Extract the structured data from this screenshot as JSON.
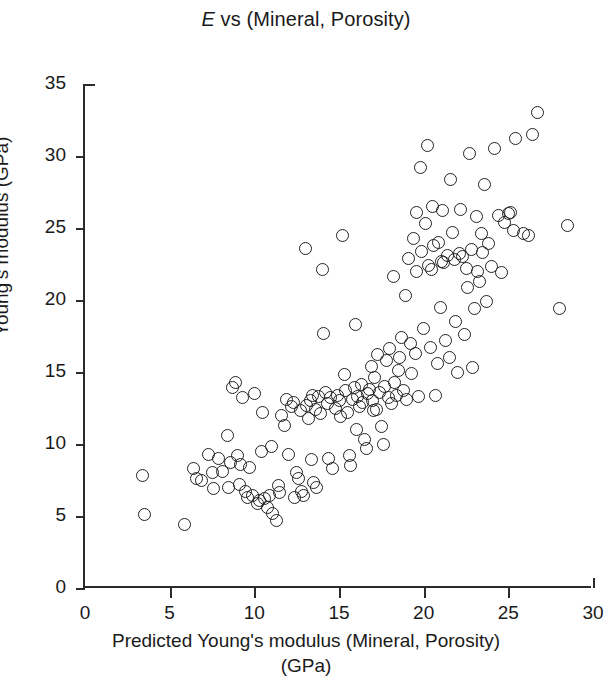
{
  "chart_data": {
    "type": "scatter",
    "title": "E vs (Mineral, Porosity)",
    "title_italic_prefix": "E",
    "title_rest": " vs (Mineral, Porosity)",
    "xlabel_line1": "Predicted Young's modulus (Mineral, Porosity)",
    "xlabel_line2": "(GPa)",
    "ylabel": "Young's modulus (GPa)",
    "xlim": [
      0,
      30
    ],
    "ylim": [
      0,
      35
    ],
    "xticks": [
      0,
      5,
      10,
      15,
      20,
      25,
      30
    ],
    "yticks": [
      0,
      5,
      10,
      15,
      20,
      25,
      30,
      35
    ],
    "xtick_labels": [
      "0",
      "5",
      "10",
      "15",
      "20",
      "25",
      "30"
    ],
    "ytick_labels": [
      "0",
      "5",
      "10",
      "15",
      "20",
      "25",
      "30",
      "35"
    ],
    "grid": false,
    "legend": null,
    "marker": "open-circle",
    "marker_color": "#222222",
    "n_points": 176,
    "points": [
      [
        3.4,
        7.8
      ],
      [
        3.5,
        5.1
      ],
      [
        5.9,
        4.4
      ],
      [
        6.4,
        8.3
      ],
      [
        6.6,
        7.6
      ],
      [
        6.9,
        7.5
      ],
      [
        7.3,
        9.3
      ],
      [
        7.5,
        8.0
      ],
      [
        7.6,
        6.9
      ],
      [
        7.9,
        9.0
      ],
      [
        8.1,
        8.1
      ],
      [
        8.4,
        10.6
      ],
      [
        8.5,
        7.0
      ],
      [
        8.6,
        8.7
      ],
      [
        8.7,
        13.9
      ],
      [
        8.9,
        14.3
      ],
      [
        9.0,
        9.2
      ],
      [
        9.1,
        7.2
      ],
      [
        9.3,
        13.2
      ],
      [
        9.5,
        6.7
      ],
      [
        9.6,
        6.3
      ],
      [
        9.7,
        8.4
      ],
      [
        9.9,
        6.4
      ],
      [
        10.0,
        13.5
      ],
      [
        10.2,
        5.9
      ],
      [
        10.3,
        6.1
      ],
      [
        10.4,
        9.5
      ],
      [
        10.5,
        12.2
      ],
      [
        10.6,
        6.2
      ],
      [
        10.8,
        5.6
      ],
      [
        10.9,
        6.4
      ],
      [
        11.0,
        9.8
      ],
      [
        11.1,
        5.2
      ],
      [
        11.3,
        4.7
      ],
      [
        11.4,
        7.1
      ],
      [
        11.5,
        6.6
      ],
      [
        11.6,
        12.0
      ],
      [
        11.8,
        11.3
      ],
      [
        11.9,
        13.1
      ],
      [
        12.0,
        9.3
      ],
      [
        12.2,
        12.6
      ],
      [
        12.3,
        12.9
      ],
      [
        12.5,
        8.0
      ],
      [
        12.6,
        7.6
      ],
      [
        12.7,
        12.3
      ],
      [
        12.8,
        6.7
      ],
      [
        12.9,
        6.4
      ],
      [
        13.0,
        23.6
      ],
      [
        13.1,
        12.7
      ],
      [
        13.2,
        11.8
      ],
      [
        13.3,
        13.0
      ],
      [
        13.4,
        8.9
      ],
      [
        13.5,
        7.3
      ],
      [
        13.6,
        12.4
      ],
      [
        13.7,
        7.0
      ],
      [
        13.8,
        13.3
      ],
      [
        13.9,
        12.1
      ],
      [
        14.0,
        22.1
      ],
      [
        14.1,
        17.7
      ],
      [
        14.2,
        13.6
      ],
      [
        14.3,
        12.8
      ],
      [
        14.4,
        9.0
      ],
      [
        14.5,
        13.2
      ],
      [
        14.6,
        8.3
      ],
      [
        14.8,
        12.5
      ],
      [
        14.9,
        13.4
      ],
      [
        15.0,
        13.0
      ],
      [
        15.1,
        11.9
      ],
      [
        15.2,
        24.5
      ],
      [
        15.3,
        14.8
      ],
      [
        15.4,
        13.7
      ],
      [
        15.5,
        12.2
      ],
      [
        15.6,
        9.2
      ],
      [
        15.7,
        8.5
      ],
      [
        15.8,
        13.1
      ],
      [
        15.9,
        13.9
      ],
      [
        16.0,
        18.3
      ],
      [
        16.1,
        13.3
      ],
      [
        16.2,
        12.6
      ],
      [
        16.3,
        14.1
      ],
      [
        16.4,
        12.9
      ],
      [
        16.5,
        10.3
      ],
      [
        16.6,
        9.7
      ],
      [
        16.7,
        13.5
      ],
      [
        16.8,
        13.8
      ],
      [
        16.9,
        15.4
      ],
      [
        17.0,
        13.0
      ],
      [
        17.1,
        14.6
      ],
      [
        17.2,
        12.4
      ],
      [
        17.3,
        16.2
      ],
      [
        17.4,
        13.6
      ],
      [
        17.5,
        11.2
      ],
      [
        17.6,
        10.0
      ],
      [
        17.7,
        14.0
      ],
      [
        17.8,
        15.8
      ],
      [
        17.9,
        13.2
      ],
      [
        18.0,
        16.6
      ],
      [
        18.1,
        12.8
      ],
      [
        18.2,
        21.6
      ],
      [
        18.3,
        14.3
      ],
      [
        18.4,
        13.4
      ],
      [
        18.5,
        15.1
      ],
      [
        18.6,
        16.0
      ],
      [
        18.7,
        17.4
      ],
      [
        18.8,
        13.7
      ],
      [
        18.9,
        20.3
      ],
      [
        19.0,
        13.1
      ],
      [
        19.1,
        22.9
      ],
      [
        19.2,
        17.0
      ],
      [
        19.3,
        14.9
      ],
      [
        19.4,
        24.3
      ],
      [
        19.5,
        16.3
      ],
      [
        19.6,
        26.1
      ],
      [
        19.7,
        13.3
      ],
      [
        19.8,
        29.2
      ],
      [
        19.9,
        23.4
      ],
      [
        20.0,
        18.0
      ],
      [
        20.1,
        25.3
      ],
      [
        20.2,
        30.7
      ],
      [
        20.3,
        22.4
      ],
      [
        20.4,
        16.7
      ],
      [
        20.5,
        26.5
      ],
      [
        20.6,
        23.8
      ],
      [
        20.7,
        13.4
      ],
      [
        20.8,
        15.6
      ],
      [
        20.9,
        24.0
      ],
      [
        21.0,
        19.5
      ],
      [
        21.1,
        26.2
      ],
      [
        21.2,
        22.6
      ],
      [
        21.3,
        17.2
      ],
      [
        21.4,
        23.1
      ],
      [
        21.5,
        16.0
      ],
      [
        21.6,
        28.4
      ],
      [
        21.7,
        24.7
      ],
      [
        21.8,
        22.8
      ],
      [
        21.9,
        18.5
      ],
      [
        22.0,
        15.0
      ],
      [
        22.1,
        23.2
      ],
      [
        22.2,
        26.3
      ],
      [
        22.3,
        23.0
      ],
      [
        22.4,
        17.6
      ],
      [
        22.5,
        22.2
      ],
      [
        22.6,
        20.9
      ],
      [
        22.7,
        30.2
      ],
      [
        22.8,
        23.5
      ],
      [
        22.9,
        15.3
      ],
      [
        23.0,
        19.4
      ],
      [
        23.1,
        25.8
      ],
      [
        23.2,
        22.0
      ],
      [
        23.3,
        21.3
      ],
      [
        23.4,
        24.6
      ],
      [
        23.5,
        23.3
      ],
      [
        23.6,
        28.0
      ],
      [
        23.7,
        19.9
      ],
      [
        23.8,
        23.9
      ],
      [
        24.0,
        22.3
      ],
      [
        24.2,
        30.5
      ],
      [
        24.4,
        25.9
      ],
      [
        24.6,
        21.9
      ],
      [
        24.8,
        25.4
      ],
      [
        25.0,
        26.0
      ],
      [
        25.1,
        26.1
      ],
      [
        25.3,
        24.8
      ],
      [
        25.4,
        31.2
      ],
      [
        25.9,
        24.6
      ],
      [
        26.2,
        24.5
      ],
      [
        26.4,
        31.5
      ],
      [
        26.7,
        33.0
      ],
      [
        28.0,
        19.4
      ],
      [
        28.5,
        25.2
      ],
      [
        12.4,
        6.3
      ],
      [
        19.55,
        22.0
      ],
      [
        21.05,
        22.7
      ],
      [
        17.05,
        12.3
      ],
      [
        20.45,
        22.1
      ],
      [
        13.45,
        13.4
      ],
      [
        16.05,
        11.0
      ],
      [
        9.2,
        8.6
      ]
    ]
  }
}
